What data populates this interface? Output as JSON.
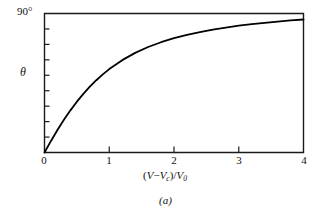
{
  "figure": {
    "caption": "(a)",
    "axis_top_label": "90°",
    "y_axis_title": "θ",
    "x_axis_title_parts": {
      "open_paren": "(",
      "v1": "V",
      "minus": "−",
      "v2": "V",
      "v2_sub": "c",
      "close_paren": ")",
      "slash": "/",
      "v3": "V",
      "v3_sub": "0"
    },
    "x_axis_title_text": "(V−Vc)/V0"
  },
  "chart_data": {
    "type": "line",
    "title": "",
    "subtitle": "",
    "xlabel": "(V−Vc)/V0",
    "ylabel": "θ",
    "xlim": [
      0,
      4
    ],
    "ylim": [
      0,
      90
    ],
    "x_tick_labels": [
      "0",
      "1",
      "2",
      "3",
      "4"
    ],
    "x_ticks": [
      0,
      1,
      2,
      3,
      4
    ],
    "y_ticks": [
      0,
      10,
      20,
      30,
      40,
      50,
      60,
      70,
      80,
      90
    ],
    "y_tick_labels": [
      "",
      "",
      "",
      "",
      "",
      "",
      "",
      "",
      "",
      "90°"
    ],
    "y_axis_unit": "degrees",
    "grid": false,
    "legend": null,
    "legend_position": "none",
    "line_color": "#000000",
    "line_width": 1.8,
    "axis_color": "#1a1a1a",
    "background_color": "#ffffff",
    "series": [
      {
        "name": "theta",
        "x": [
          0.0,
          0.1,
          0.2,
          0.3,
          0.4,
          0.5,
          0.6,
          0.7,
          0.8,
          0.9,
          1.0,
          1.2,
          1.4,
          1.6,
          1.8,
          2.0,
          2.2,
          2.4,
          2.6,
          2.8,
          3.0,
          3.2,
          3.4,
          3.6,
          3.8,
          4.0
        ],
        "values": [
          0.0,
          7.5,
          14.6,
          21.2,
          27.3,
          32.9,
          38.0,
          42.6,
          46.8,
          50.6,
          54.0,
          59.8,
          64.5,
          68.3,
          71.4,
          74.0,
          76.2,
          78.0,
          79.6,
          80.9,
          82.1,
          83.1,
          84.0,
          84.8,
          85.5,
          86.1
        ]
      }
    ],
    "annotations": [
      {
        "text": "(a)",
        "role": "figure-caption",
        "x": 2.0,
        "y": -0.35
      }
    ]
  }
}
